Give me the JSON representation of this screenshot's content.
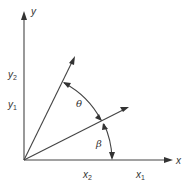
{
  "diagram": {
    "type": "vector-rotation",
    "colors": {
      "stroke": "#444444",
      "text": "#333333",
      "background": "#ffffff"
    },
    "origin": {
      "x": 24,
      "y": 160
    },
    "axes": {
      "x": {
        "label": "x",
        "end": {
          "x": 172,
          "y": 160
        }
      },
      "y": {
        "label": "y",
        "end": {
          "x": 24,
          "y": 12
        }
      }
    },
    "vectors": [
      {
        "name": "vector-1",
        "from": "origin",
        "to": {
          "x": 128,
          "y": 107
        },
        "endpoint_labels": {
          "x": "x1",
          "y": "y1"
        }
      },
      {
        "name": "vector-2",
        "from": "origin",
        "to": {
          "x": 74,
          "y": 57
        },
        "endpoint_labels": {
          "x": "x2",
          "y": "y2"
        }
      }
    ],
    "angles": [
      {
        "symbol": "θ",
        "meaning": "angle between vector-1 and vector-2",
        "label_pos": {
          "x": 79,
          "y": 106
        }
      },
      {
        "symbol": "β",
        "meaning": "angle between x axis and vector-1",
        "label_pos": {
          "x": 97,
          "y": 146
        }
      }
    ],
    "labels": {
      "x_axis": "x",
      "y_axis": "y",
      "x1": {
        "base": "x",
        "sub": "1"
      },
      "x2": {
        "base": "x",
        "sub": "2"
      },
      "y1": {
        "base": "y",
        "sub": "1"
      },
      "y2": {
        "base": "y",
        "sub": "2"
      },
      "theta": "θ",
      "beta": "β"
    }
  }
}
